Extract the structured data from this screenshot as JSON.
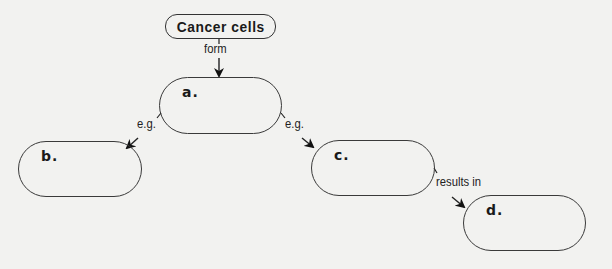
{
  "diagram": {
    "root": {
      "label": "Cancer cells"
    },
    "nodes": [
      {
        "id": "a",
        "label": "a.",
        "text": ""
      },
      {
        "id": "b",
        "label": "b.",
        "text": ""
      },
      {
        "id": "c",
        "label": "c.",
        "text": ""
      },
      {
        "id": "d",
        "label": "d.",
        "text": ""
      }
    ],
    "edges": [
      {
        "from": "Cancer cells",
        "to": "a",
        "label": "form"
      },
      {
        "from": "a",
        "to": "b",
        "label": "e.g."
      },
      {
        "from": "a",
        "to": "c",
        "label": "e.g."
      },
      {
        "from": "c",
        "to": "d",
        "label": "results in"
      }
    ],
    "colors": {
      "background": "#f2f2f0",
      "stroke": "#333333",
      "text": "#1a1a1a"
    }
  }
}
